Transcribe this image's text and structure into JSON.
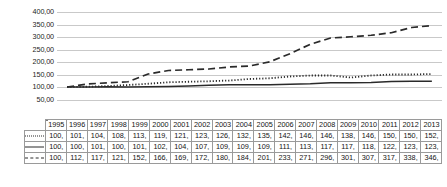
{
  "chart_data": {
    "type": "line",
    "title": "",
    "xlabel": "",
    "ylabel": "",
    "ylim": [
      0,
      400
    ],
    "ytick_labels": [
      "400,00",
      "350,00",
      "300,00",
      "250,00",
      "200,00",
      "150,00",
      "100,00",
      "50,00"
    ],
    "ytick_values": [
      400,
      350,
      300,
      250,
      200,
      150,
      100,
      50
    ],
    "grid": true,
    "legend_position": "table-row-headers",
    "categories": [
      "1995",
      "1996",
      "1997",
      "1998",
      "1999",
      "2000",
      "2001",
      "2002",
      "2003",
      "2004",
      "2005",
      "2006",
      "2007",
      "2008",
      "2009",
      "2010",
      "2011",
      "2012",
      "2013"
    ],
    "series": [
      {
        "name": "GDPM",
        "line_style": "dotted",
        "values": [
          100,
          101,
          104,
          108,
          113,
          119,
          121,
          123,
          126,
          132,
          135,
          142,
          146,
          146,
          138,
          146,
          150,
          150,
          152
        ],
        "cell_labels": [
          "100,",
          "101,",
          "104,",
          "108,",
          "113,",
          "119,",
          "121,",
          "123,",
          "126,",
          "132,",
          "135,",
          "142,",
          "146,",
          "146,",
          "138,",
          "146,",
          "150,",
          "150,",
          "152,"
        ]
      },
      {
        "name": "CPI",
        "line_style": "solid",
        "values": [
          100,
          100,
          101,
          100,
          101,
          102,
          104,
          107,
          109,
          109,
          109,
          111,
          113,
          117,
          117,
          118,
          122,
          123,
          123
        ],
        "cell_labels": [
          "100,",
          "100,",
          "101,",
          "100,",
          "101,",
          "102,",
          "104,",
          "107,",
          "109,",
          "109,",
          "109,",
          "111,",
          "113,",
          "117,",
          "117,",
          "118,",
          "122,",
          "123,",
          "123,"
        ]
      },
      {
        "name": "M3",
        "line_style": "dashed",
        "values": [
          100,
          112,
          117,
          121,
          152,
          166,
          169,
          172,
          180,
          184,
          201,
          233,
          271,
          296,
          301,
          307,
          317,
          338,
          346
        ],
        "cell_labels": [
          "100,",
          "112,",
          "117,",
          "121,",
          "152,",
          "166,",
          "169,",
          "172,",
          "180,",
          "184,",
          "201,",
          "233,",
          "271,",
          "296,",
          "301,",
          "307,",
          "317,",
          "338,",
          "346,"
        ]
      }
    ],
    "colors": {
      "line": "#2a2a2a",
      "grid": "#c9c9c9",
      "table_border": "#9a9a9a",
      "text": "#151515"
    }
  }
}
